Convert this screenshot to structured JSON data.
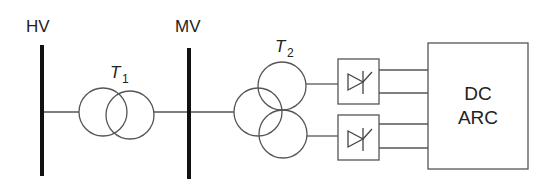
{
  "diagram": {
    "type": "single-line electrical schematic",
    "buses": [
      {
        "id": "hv",
        "label": "HV"
      },
      {
        "id": "mv",
        "label": "MV"
      }
    ],
    "transformers": [
      {
        "id": "t1",
        "label_main": "T",
        "label_sub": "1",
        "windings": 2
      },
      {
        "id": "t2",
        "label_main": "T",
        "label_sub": "2",
        "windings": 3
      }
    ],
    "converters": [
      {
        "id": "thyristor-rectifier-top",
        "symbol": "thyristor"
      },
      {
        "id": "thyristor-rectifier-bottom",
        "symbol": "thyristor"
      }
    ],
    "load": {
      "id": "dc-arc",
      "line1": "DC",
      "line2": "ARC"
    },
    "colors": {
      "line": "#555555",
      "bus": "#111111",
      "text": "#222222",
      "background": "#ffffff"
    }
  }
}
